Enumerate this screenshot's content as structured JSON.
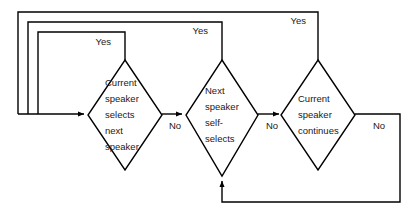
{
  "diagram": {
    "type": "flowchart",
    "nodes": [
      {
        "id": "node-1",
        "shape": "diamond",
        "text_lines": [
          "Current",
          "speaker",
          "selects",
          "next",
          "speaker"
        ],
        "cx": 125,
        "cy": 115,
        "rx": 37,
        "ry": 55
      },
      {
        "id": "node-2",
        "shape": "diamond",
        "text_lines": [
          "Next",
          "speaker",
          "self-",
          "selects"
        ],
        "cx": 222,
        "cy": 115,
        "rx": 36,
        "ry": 55
      },
      {
        "id": "node-3",
        "shape": "diamond",
        "text_lines": [
          "Current",
          "speaker",
          "continues"
        ],
        "cx": 318,
        "cy": 115,
        "rx": 37,
        "ry": 55
      }
    ],
    "edge_labels": [
      {
        "id": "yes-1",
        "text": "Yes",
        "x": 111,
        "y": 42,
        "anchor": "end"
      },
      {
        "id": "yes-2",
        "text": "Yes",
        "x": 208,
        "y": 31,
        "anchor": "end"
      },
      {
        "id": "yes-3",
        "text": "Yes",
        "x": 306,
        "y": 21,
        "anchor": "end"
      },
      {
        "id": "no-1",
        "text": "No",
        "x": 175,
        "y": 126,
        "anchor": "middle"
      },
      {
        "id": "no-2",
        "text": "No",
        "x": 272,
        "y": 126,
        "anchor": "middle"
      },
      {
        "id": "no-3",
        "text": "No",
        "x": 379,
        "y": 126,
        "anchor": "middle"
      }
    ],
    "paths": {
      "loop_yes_1": "M 125 60 L 125 32 L 38 32 L 38 114",
      "loop_yes_2": "M 222 60 L 222 22 L 28 22 L 28 114",
      "loop_yes_3": "M 318 60 L 318 12 L 18 12 L 18 114",
      "entry_rail": "M 18 114 L 84 114",
      "no_1": "M 162 114 L 182 114",
      "no_2": "M 258 114 L 279 114",
      "no_3_out": "M 355 114 L 400 114 L 400 202 L 222 202 L 222 181",
      "bottom_return_stub": "M 222 202 L 222 181"
    },
    "colors": {
      "line": "#000000",
      "background": "#ffffff",
      "text": "#1a1a1a"
    }
  }
}
